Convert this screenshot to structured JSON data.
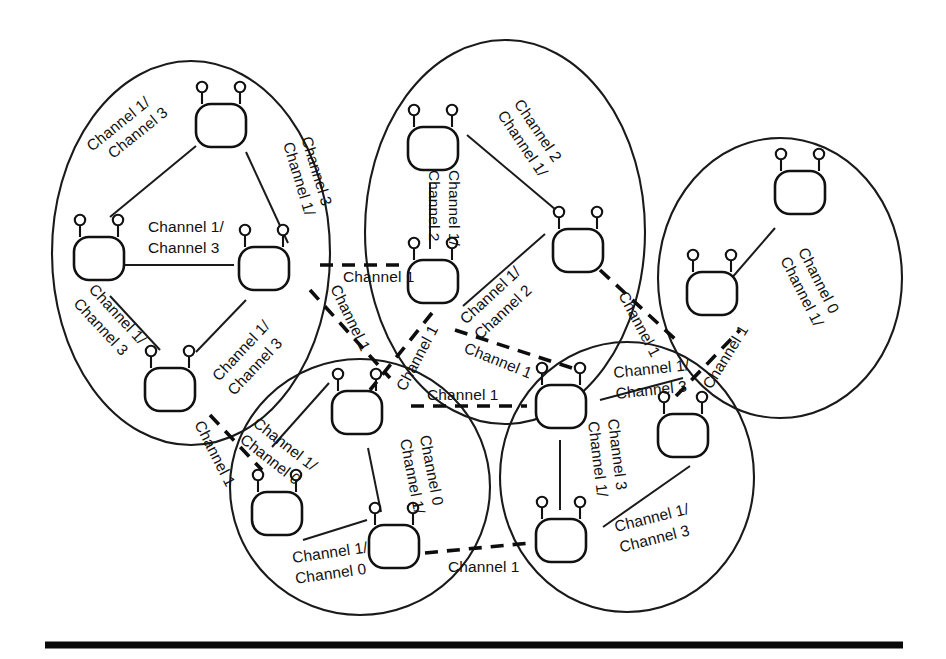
{
  "figure": {
    "background_color": "#ffffff",
    "line_color": "#111111",
    "width": 946,
    "height": 659
  },
  "legend_terms": {
    "channel_0": "Channel 0",
    "channel_1": "Channel 1",
    "channel_2": "Channel 2",
    "channel_3": "Channel 3"
  },
  "clusters": [
    {
      "id": "cluster-left",
      "name": "left-cluster",
      "nodes": 3,
      "intra_channel_pair": "Channel 1/ Channel 3"
    },
    {
      "id": "cluster-top-center",
      "name": "top-center-cluster",
      "nodes": 3,
      "intra_channel_pair": "Channel 1/ Channel 2"
    },
    {
      "id": "cluster-right",
      "name": "right-cluster",
      "nodes": 2,
      "intra_channel_pair": "Channel 1/ Channel 0"
    },
    {
      "id": "cluster-bottom-left",
      "name": "bottom-left-cluster",
      "nodes": 3,
      "intra_channel_pair": "Channel 1/ Channel 0"
    },
    {
      "id": "cluster-bottom-right",
      "name": "bottom-right-cluster",
      "nodes": 3,
      "intra_channel_pair": "Channel 1/ Channel 3"
    }
  ],
  "labels": {
    "l1_top_left_line1": "Channel 1/",
    "l1_top_left_line2": "Channel 3",
    "l1_top_right_line1": "Channel 1/",
    "l1_top_right_line2": "Channel 3",
    "l1_mid_line1": "Channel 1/",
    "l1_mid_line2": "Channel 3",
    "l1_bottom_left_line1": "Channel 1/",
    "l1_bottom_left_line2": "Channel 3",
    "l1_bottom_right_line1": "Channel 1/",
    "l1_bottom_right_line2": "Channel 3",
    "tc_top_right_line1": "Channel 1/",
    "tc_top_right_line2": "Channel 2",
    "tc_vertical_line1": "Channel 1/",
    "tc_vertical_line2": "Channel 2",
    "tc_bottom_right_line1": "Channel 1/",
    "tc_bottom_right_line2": "Channel 2",
    "r_line1": "Channel 1/",
    "r_line2": "Channel 0",
    "bl_top_line1": "Channel 1/",
    "bl_top_line2": "Channel 0",
    "bl_vertical_line1": "Channel 1/",
    "bl_vertical_line2": "Channel 0",
    "bl_bottom_line1": "Channel 1/",
    "bl_bottom_line2": "Channel 0",
    "br_top_line1": "Channel 1/",
    "br_top_line2": "Channel 3",
    "br_vertical_line1": "Channel 1/",
    "br_vertical_line2": "Channel 3",
    "br_bottom_line1": "Channel 1/",
    "br_bottom_line2": "Channel 3",
    "inter_left_to_topcenter": "Channel 1",
    "inter_left_down_diag": "Channel 1",
    "inter_topcenter_down_diag": "Channel 1",
    "inter_topcenter_to_right_diag": "Channel 1",
    "inter_topcenter_to_right": "Channel 1",
    "inter_bottomleft_to_bottomright": "Channel 1",
    "inter_bottomright_to_right": "Channel 1",
    "inter_bottomleft_low": "Channel 1",
    "inter_left_lower_diag": "Channel 1"
  }
}
